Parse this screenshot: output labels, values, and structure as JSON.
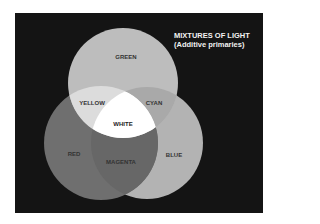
{
  "title": {
    "line1": "MIXTURES OF LIGHT",
    "line2": "(Additive primaries)"
  },
  "circles": [
    {
      "name": "green",
      "label": "GREEN",
      "cx": 123,
      "cy": 83,
      "r": 55,
      "color": "#bdbdbd"
    },
    {
      "name": "red",
      "label": "RED",
      "cx": 101,
      "cy": 143,
      "r": 57,
      "color": "#6f6f6f"
    },
    {
      "name": "blue",
      "label": "BLUE",
      "cx": 147,
      "cy": 143,
      "r": 56,
      "color": "#b3b3b3"
    }
  ],
  "overlaps": {
    "yellow": {
      "label": "YELLOW",
      "color": "#dcdcdc"
    },
    "cyan": {
      "label": "CYAN",
      "color": "#a9a9a9"
    },
    "magenta": {
      "label": "MAGENTA",
      "color": "#676767"
    },
    "white": {
      "label": "WHITE",
      "color": "#ffffff"
    }
  },
  "colors": {
    "background": "#141414",
    "page": "#ffffff"
  }
}
